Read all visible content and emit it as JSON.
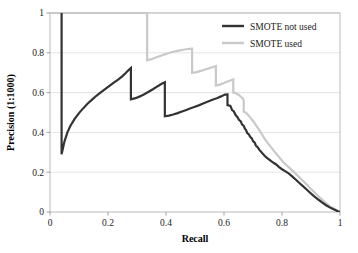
{
  "chart_data": {
    "type": "line",
    "title": "",
    "xlabel": "Recall",
    "ylabel": "Precision (1:1000)",
    "xlim": [
      0,
      1
    ],
    "ylim": [
      0,
      1
    ],
    "xticks": [
      "0",
      "0.2",
      "0.4",
      "0.6",
      "0.8",
      "1"
    ],
    "yticks": [
      "0",
      "0.2",
      "0.4",
      "0.6",
      "0.8",
      "1"
    ],
    "xtick_values": [
      0,
      0.2,
      0.4,
      0.6,
      0.8,
      1
    ],
    "ytick_values": [
      0,
      0.2,
      0.4,
      0.6,
      0.8,
      1
    ],
    "grid": "horizontal",
    "grid_color": "#d9d9d9",
    "legend_position": "top-right",
    "series": [
      {
        "name": "SMOTE not used",
        "color": "#333333",
        "width": 2.2,
        "points": [
          [
            0.04,
            1.0
          ],
          [
            0.04,
            0.29
          ],
          [
            0.05,
            0.355
          ],
          [
            0.06,
            0.4
          ],
          [
            0.07,
            0.432
          ],
          [
            0.085,
            0.468
          ],
          [
            0.1,
            0.497
          ],
          [
            0.115,
            0.522
          ],
          [
            0.13,
            0.545
          ],
          [
            0.145,
            0.565
          ],
          [
            0.16,
            0.584
          ],
          [
            0.175,
            0.601
          ],
          [
            0.19,
            0.618
          ],
          [
            0.205,
            0.634
          ],
          [
            0.22,
            0.65
          ],
          [
            0.235,
            0.665
          ],
          [
            0.25,
            0.683
          ],
          [
            0.262,
            0.7
          ],
          [
            0.272,
            0.715
          ],
          [
            0.279,
            0.724
          ],
          [
            0.279,
            0.566
          ],
          [
            0.295,
            0.572
          ],
          [
            0.31,
            0.581
          ],
          [
            0.325,
            0.592
          ],
          [
            0.34,
            0.604
          ],
          [
            0.355,
            0.617
          ],
          [
            0.37,
            0.631
          ],
          [
            0.385,
            0.644
          ],
          [
            0.396,
            0.652
          ],
          [
            0.396,
            0.481
          ],
          [
            0.41,
            0.484
          ],
          [
            0.425,
            0.49
          ],
          [
            0.44,
            0.497
          ],
          [
            0.455,
            0.505
          ],
          [
            0.47,
            0.513
          ],
          [
            0.485,
            0.521
          ],
          [
            0.5,
            0.529
          ],
          [
            0.515,
            0.537
          ],
          [
            0.53,
            0.546
          ],
          [
            0.545,
            0.555
          ],
          [
            0.56,
            0.564
          ],
          [
            0.575,
            0.572
          ],
          [
            0.59,
            0.581
          ],
          [
            0.603,
            0.59
          ],
          [
            0.612,
            0.591
          ],
          [
            0.612,
            0.537
          ],
          [
            0.622,
            0.533
          ],
          [
            0.628,
            0.512
          ],
          [
            0.634,
            0.505
          ],
          [
            0.64,
            0.487
          ],
          [
            0.646,
            0.478
          ],
          [
            0.652,
            0.462
          ],
          [
            0.658,
            0.455
          ],
          [
            0.662,
            0.44
          ],
          [
            0.668,
            0.433
          ],
          [
            0.672,
            0.419
          ],
          [
            0.676,
            0.412
          ],
          [
            0.68,
            0.397
          ],
          [
            0.686,
            0.39
          ],
          [
            0.69,
            0.378
          ],
          [
            0.696,
            0.37
          ],
          [
            0.7,
            0.356
          ],
          [
            0.706,
            0.348
          ],
          [
            0.71,
            0.334
          ],
          [
            0.716,
            0.326
          ],
          [
            0.722,
            0.312
          ],
          [
            0.728,
            0.303
          ],
          [
            0.734,
            0.292
          ],
          [
            0.74,
            0.283
          ],
          [
            0.748,
            0.272
          ],
          [
            0.756,
            0.263
          ],
          [
            0.764,
            0.254
          ],
          [
            0.772,
            0.246
          ],
          [
            0.78,
            0.239
          ],
          [
            0.79,
            0.226
          ],
          [
            0.8,
            0.215
          ],
          [
            0.812,
            0.204
          ],
          [
            0.824,
            0.193
          ],
          [
            0.836,
            0.178
          ],
          [
            0.848,
            0.162
          ],
          [
            0.86,
            0.146
          ],
          [
            0.872,
            0.13
          ],
          [
            0.884,
            0.114
          ],
          [
            0.896,
            0.098
          ],
          [
            0.91,
            0.08
          ],
          [
            0.924,
            0.064
          ],
          [
            0.938,
            0.048
          ],
          [
            0.952,
            0.034
          ],
          [
            0.966,
            0.022
          ],
          [
            0.98,
            0.012
          ],
          [
            0.992,
            0.004
          ],
          [
            1.0,
            0.0
          ]
        ]
      },
      {
        "name": "SMOTE used",
        "color": "#c9c9c9",
        "width": 2.2,
        "points": [
          [
            0.0,
            1.0
          ],
          [
            0.335,
            1.0
          ],
          [
            0.335,
            0.762
          ],
          [
            0.35,
            0.768
          ],
          [
            0.365,
            0.776
          ],
          [
            0.38,
            0.784
          ],
          [
            0.395,
            0.792
          ],
          [
            0.41,
            0.799
          ],
          [
            0.425,
            0.805
          ],
          [
            0.44,
            0.81
          ],
          [
            0.455,
            0.814
          ],
          [
            0.47,
            0.818
          ],
          [
            0.482,
            0.82
          ],
          [
            0.49,
            0.821
          ],
          [
            0.49,
            0.699
          ],
          [
            0.505,
            0.703
          ],
          [
            0.52,
            0.709
          ],
          [
            0.535,
            0.716
          ],
          [
            0.55,
            0.723
          ],
          [
            0.562,
            0.729
          ],
          [
            0.572,
            0.734
          ],
          [
            0.572,
            0.635
          ],
          [
            0.585,
            0.64
          ],
          [
            0.598,
            0.647
          ],
          [
            0.61,
            0.654
          ],
          [
            0.622,
            0.661
          ],
          [
            0.632,
            0.667
          ],
          [
            0.632,
            0.6
          ],
          [
            0.64,
            0.599
          ],
          [
            0.646,
            0.592
          ],
          [
            0.652,
            0.588
          ],
          [
            0.658,
            0.579
          ],
          [
            0.664,
            0.572
          ],
          [
            0.668,
            0.561
          ],
          [
            0.668,
            0.505
          ],
          [
            0.674,
            0.5
          ],
          [
            0.68,
            0.492
          ],
          [
            0.686,
            0.483
          ],
          [
            0.692,
            0.472
          ],
          [
            0.698,
            0.461
          ],
          [
            0.704,
            0.45
          ],
          [
            0.71,
            0.437
          ],
          [
            0.716,
            0.424
          ],
          [
            0.722,
            0.411
          ],
          [
            0.728,
            0.397
          ],
          [
            0.734,
            0.383
          ],
          [
            0.74,
            0.368
          ],
          [
            0.748,
            0.352
          ],
          [
            0.756,
            0.337
          ],
          [
            0.764,
            0.322
          ],
          [
            0.772,
            0.307
          ],
          [
            0.78,
            0.293
          ],
          [
            0.79,
            0.276
          ],
          [
            0.8,
            0.258
          ],
          [
            0.812,
            0.24
          ],
          [
            0.824,
            0.224
          ],
          [
            0.836,
            0.208
          ],
          [
            0.848,
            0.191
          ],
          [
            0.86,
            0.174
          ],
          [
            0.872,
            0.157
          ],
          [
            0.884,
            0.14
          ],
          [
            0.896,
            0.122
          ],
          [
            0.91,
            0.102
          ],
          [
            0.924,
            0.082
          ],
          [
            0.938,
            0.062
          ],
          [
            0.952,
            0.044
          ],
          [
            0.966,
            0.028
          ],
          [
            0.98,
            0.016
          ],
          [
            0.992,
            0.006
          ],
          [
            1.0,
            0.0
          ]
        ]
      }
    ],
    "legend": [
      {
        "label": "SMOTE not used",
        "color": "#333333"
      },
      {
        "label": "SMOTE used",
        "color": "#c9c9c9"
      }
    ]
  }
}
